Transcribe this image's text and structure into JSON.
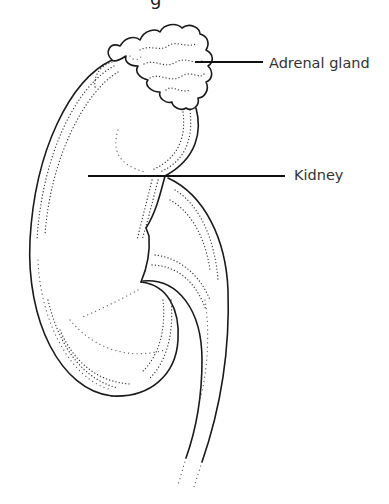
{
  "diagram": {
    "title_fragment": "g",
    "labels": [
      {
        "id": "adrenal-gland",
        "text": "Adrenal gland"
      },
      {
        "id": "kidney",
        "text": "Kidney"
      }
    ],
    "colors": {
      "background": "#ffffff",
      "ink": "#1a1a1a",
      "label_text": "#333333"
    }
  }
}
